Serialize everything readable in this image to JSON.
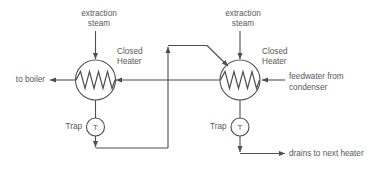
{
  "diagram": {
    "stroke_color": "#4e4e50",
    "text_color": "#58585a",
    "background_color": "#ffffff",
    "labels": {
      "extraction_steam_left": "extraction\nsteam",
      "extraction_steam_left_line1": "extraction",
      "extraction_steam_left_line2": "steam",
      "extraction_steam_right_line1": "extraction",
      "extraction_steam_right_line2": "steam",
      "closed_heater_left_line1": "Closed",
      "closed_heater_left_line2": "Heater",
      "closed_heater_right_line1": "Closed",
      "closed_heater_right_line2": "Heater",
      "to_boiler": "to boiler",
      "feedwater_line1": "feedwater from",
      "feedwater_line2": "condenser",
      "drains_to_next_heater": "drains to next heater",
      "trap_left": "Trap",
      "trap_right": "Trap",
      "trap_symbol_left": "T",
      "trap_symbol_right": "T"
    },
    "components": [
      {
        "name": "closed-heater-left",
        "type": "heat-exchanger",
        "cx": 95.5,
        "cy": 80,
        "r": 20
      },
      {
        "name": "closed-heater-right",
        "type": "heat-exchanger",
        "cx": 240,
        "cy": 80,
        "r": 20
      },
      {
        "name": "steam-trap-left",
        "type": "trap",
        "cx": 95.5,
        "cy": 127,
        "r": 9
      },
      {
        "name": "steam-trap-right",
        "type": "trap",
        "cx": 240,
        "cy": 127,
        "r": 9
      }
    ],
    "streams": [
      {
        "name": "extraction-steam-inlet-left",
        "direction": "down"
      },
      {
        "name": "extraction-steam-inlet-right",
        "direction": "down"
      },
      {
        "name": "feedwater-to-boiler",
        "direction": "left"
      },
      {
        "name": "feedwater-from-condenser",
        "direction": "left"
      },
      {
        "name": "feedwater-interconnect",
        "direction": "left"
      },
      {
        "name": "left-heater-drain",
        "direction": "down"
      },
      {
        "name": "right-heater-drain",
        "direction": "down"
      },
      {
        "name": "cascaded-drain-return",
        "direction": "up"
      },
      {
        "name": "drains-to-next-heater",
        "direction": "right"
      }
    ]
  }
}
